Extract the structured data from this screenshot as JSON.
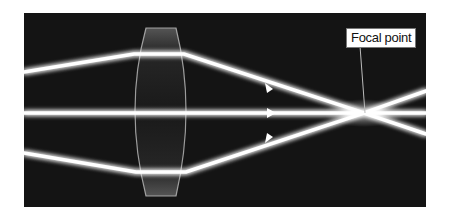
{
  "diagram": {
    "labels": {
      "focal_point": "Focal point"
    },
    "elements": {
      "lens": "biconvex lens",
      "rays": [
        "top ray",
        "middle ray",
        "bottom ray"
      ]
    },
    "colors": {
      "background": "#141414",
      "ray": "#ffffff",
      "lens": "#9a9a9a",
      "label_bg": "#ffffff"
    }
  }
}
